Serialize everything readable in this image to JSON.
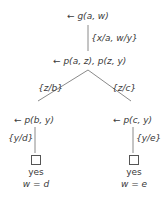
{
  "diagram": {
    "type": "SLD resolution tree",
    "root": {
      "goal": "← g(a, w)"
    },
    "edges": {
      "root_to_mid": "{x/a, w/y}",
      "mid_to_left": "{z/b}",
      "mid_to_right": "{z/c}",
      "left_to_leaf": "{y/d}",
      "right_to_leaf": "{y/e}"
    },
    "mid": {
      "goal": "← p(a, z), p(z, y)"
    },
    "left": {
      "goal": "← p(b, y)",
      "leaf": {
        "result": "yes",
        "answer": "w = d"
      }
    },
    "right": {
      "goal": "← p(c, y)",
      "leaf": {
        "result": "yes",
        "answer": "w = e"
      }
    },
    "colors": {
      "line": "#8a8a8a",
      "text": "#3a3a3a"
    }
  }
}
